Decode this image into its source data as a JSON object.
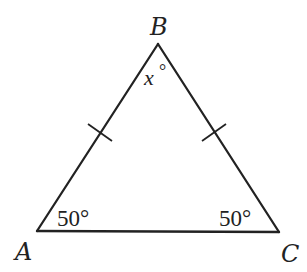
{
  "figure": {
    "type": "isosceles-triangle",
    "colors": {
      "stroke": "#222222",
      "background": "#ffffff"
    },
    "vertices": [
      {
        "id": "A",
        "label": "A",
        "x": 37,
        "y": 231
      },
      {
        "id": "B",
        "label": "B",
        "x": 158,
        "y": 44
      },
      {
        "id": "C",
        "label": "C",
        "x": 279,
        "y": 232
      }
    ],
    "angles": {
      "A": {
        "value": "50",
        "unit": "°"
      },
      "B": {
        "value": "x",
        "unit": "°"
      },
      "C": {
        "value": "50",
        "unit": "°"
      }
    },
    "congruence_marks": [
      {
        "side": "AB",
        "count": 1
      },
      {
        "side": "BC",
        "count": 1
      }
    ]
  }
}
